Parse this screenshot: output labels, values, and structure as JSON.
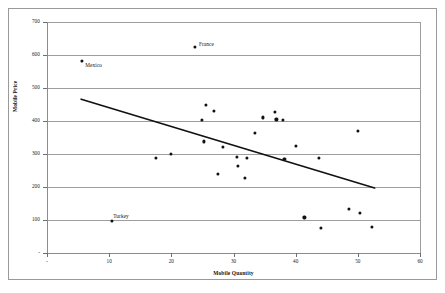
{
  "chart_data": {
    "type": "scatter",
    "title": "",
    "xlabel": "Mobile Quantity",
    "ylabel": "Mobile Price",
    "xlim": [
      0,
      60
    ],
    "ylim": [
      0,
      700
    ],
    "grid": true,
    "legend": "none",
    "x_ticks": [
      "-",
      "10",
      "20",
      "30",
      "40",
      "50",
      "60"
    ],
    "x_tick_values": [
      0,
      10,
      20,
      30,
      40,
      50,
      60
    ],
    "y_ticks": [
      "-",
      "100",
      "200",
      "300",
      "400",
      "500",
      "600",
      "700"
    ],
    "y_tick_values": [
      0,
      100,
      200,
      300,
      400,
      500,
      600,
      700
    ],
    "marker_color": "#111111",
    "gridline_color": "#9d9d9d",
    "trendline_color": "#111111",
    "points": [
      {
        "x": 5.6,
        "y": 583,
        "label": "Mexico"
      },
      {
        "x": 23.8,
        "y": 625,
        "label": "France"
      },
      {
        "x": 10.4,
        "y": 98,
        "label": "Turkey"
      },
      {
        "x": 17.5,
        "y": 288,
        "label": ""
      },
      {
        "x": 19.9,
        "y": 301,
        "label": ""
      },
      {
        "x": 24.9,
        "y": 404,
        "label": ""
      },
      {
        "x": 25.6,
        "y": 448,
        "label": ""
      },
      {
        "x": 25.2,
        "y": 338,
        "label": ""
      },
      {
        "x": 26.8,
        "y": 430,
        "label": ""
      },
      {
        "x": 27.5,
        "y": 239,
        "label": ""
      },
      {
        "x": 28.3,
        "y": 322,
        "label": ""
      },
      {
        "x": 30.6,
        "y": 292,
        "label": ""
      },
      {
        "x": 30.7,
        "y": 263,
        "label": ""
      },
      {
        "x": 31.8,
        "y": 228,
        "label": ""
      },
      {
        "x": 32.1,
        "y": 289,
        "label": ""
      },
      {
        "x": 33.4,
        "y": 364,
        "label": ""
      },
      {
        "x": 34.7,
        "y": 411,
        "label": ""
      },
      {
        "x": 36.6,
        "y": 428,
        "label": ""
      },
      {
        "x": 36.9,
        "y": 405,
        "label": ""
      },
      {
        "x": 37.9,
        "y": 404,
        "label": ""
      },
      {
        "x": 38.2,
        "y": 285,
        "label": ""
      },
      {
        "x": 40.1,
        "y": 324,
        "label": ""
      },
      {
        "x": 41.4,
        "y": 108,
        "label": ""
      },
      {
        "x": 43.8,
        "y": 289,
        "label": ""
      },
      {
        "x": 44.0,
        "y": 75,
        "label": ""
      },
      {
        "x": 48.6,
        "y": 134,
        "label": ""
      },
      {
        "x": 50.0,
        "y": 371,
        "label": ""
      },
      {
        "x": 50.3,
        "y": 121,
        "label": ""
      },
      {
        "x": 52.2,
        "y": 79,
        "label": ""
      }
    ],
    "trendline": {
      "x_start": 5.5,
      "y_start": 466,
      "x_end": 52.7,
      "y_end": 197
    }
  }
}
